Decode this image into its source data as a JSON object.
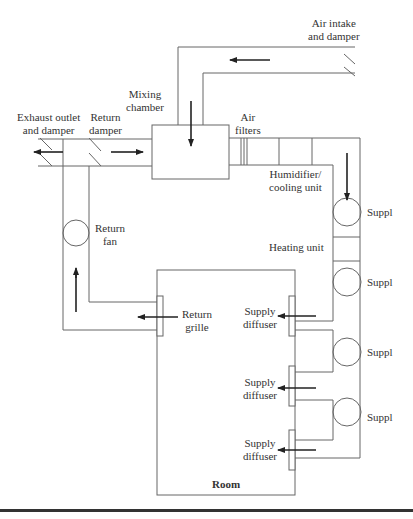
{
  "diagram": {
    "type": "hvac-schematic",
    "colors": {
      "line": "#555555",
      "arrow": "#222222",
      "text": "#333333",
      "rule": "#333333"
    },
    "labels": {
      "air_intake": [
        "Air intake",
        "and damper"
      ],
      "mixing_chamber": [
        "Mixing",
        "chamber"
      ],
      "exhaust": [
        "Exhaust outlet",
        "and damper"
      ],
      "return_damper": [
        "Return",
        "damper"
      ],
      "air_filters": [
        "Air",
        "filters"
      ],
      "humidifier": [
        "Humidifier/",
        "cooling unit"
      ],
      "heating": "Heating unit",
      "return_fan": [
        "Return",
        "fan"
      ],
      "return_grille": [
        "Return",
        "grille"
      ],
      "supply_diffuser_1": [
        "Supply",
        "diffuser"
      ],
      "supply_diffuser_2": [
        "Supply",
        "diffuser"
      ],
      "supply_diffuser_3": [
        "Supply",
        "diffuser"
      ],
      "room": "Room",
      "supply_fan_1": "Suppl",
      "supply_fan_2": "Suppl",
      "supply_fan_3": "Suppl",
      "supply_fan_4": "Suppl"
    }
  }
}
